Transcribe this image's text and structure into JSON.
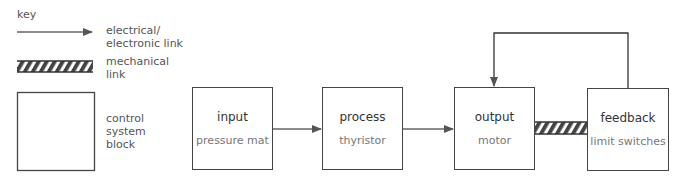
{
  "key": {
    "title": "key",
    "items": [
      {
        "symbol": "arrow",
        "label_line1": "electrical/",
        "label_line2": "electronic link"
      },
      {
        "symbol": "hatched-bar",
        "label_line1": "mechanical",
        "label_line2": "link"
      },
      {
        "symbol": "block",
        "label_line1": "control",
        "label_line2": "system",
        "label_line3": "block"
      }
    ]
  },
  "blocks": [
    {
      "title": "input",
      "subtitle": "pressure mat"
    },
    {
      "title": "process",
      "subtitle": "thyristor"
    },
    {
      "title": "output",
      "subtitle": "motor"
    },
    {
      "title": "feedback",
      "subtitle": "limit switches"
    }
  ],
  "links": [
    {
      "from": "input",
      "to": "process",
      "type": "electrical"
    },
    {
      "from": "process",
      "to": "output",
      "type": "electrical"
    },
    {
      "from": "output",
      "to": "feedback",
      "type": "mechanical"
    },
    {
      "from": "feedback",
      "to": "output",
      "type": "electrical"
    }
  ],
  "colors": {
    "line": "#444444",
    "hatch": "#444444",
    "text": "#555555"
  }
}
